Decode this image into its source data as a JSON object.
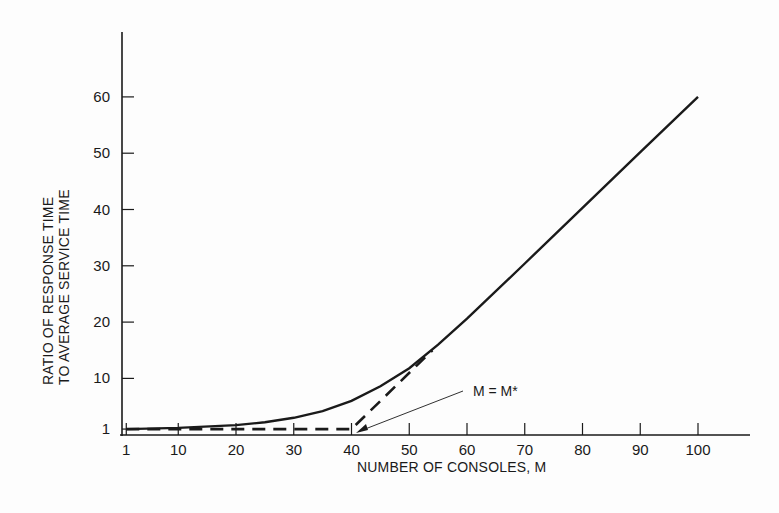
{
  "chart_data": {
    "type": "line",
    "title": "",
    "xlabel": "NUMBER OF CONSOLES, M",
    "ylabel": [
      "RATIO OF RESPONSE TIME",
      "TO AVERAGE SERVICE TIME"
    ],
    "xlim": [
      0,
      110
    ],
    "ylim": [
      0,
      70
    ],
    "x_ticks": [
      1,
      10,
      20,
      30,
      40,
      50,
      60,
      70,
      80,
      90,
      100
    ],
    "y_ticks": [
      1,
      10,
      20,
      30,
      40,
      50,
      60
    ],
    "grid": false,
    "legend": null,
    "series": [
      {
        "name": "response-time-ratio",
        "style": "solid",
        "x": [
          1,
          10,
          20,
          25,
          30,
          35,
          40,
          45,
          50,
          55,
          60,
          70,
          80,
          90,
          100
        ],
        "values": [
          1,
          1.2,
          1.7,
          2.2,
          3.0,
          4.2,
          6.0,
          8.6,
          11.8,
          16.0,
          20.6,
          30.4,
          40.3,
          50.2,
          60
        ]
      },
      {
        "name": "asymptotes",
        "style": "dashed",
        "x": [
          1,
          40,
          54
        ],
        "values": [
          1,
          1,
          15
        ]
      }
    ],
    "annotations": [
      {
        "text": "M = M*",
        "points_to": {
          "x": 40,
          "y": 1
        }
      }
    ]
  }
}
